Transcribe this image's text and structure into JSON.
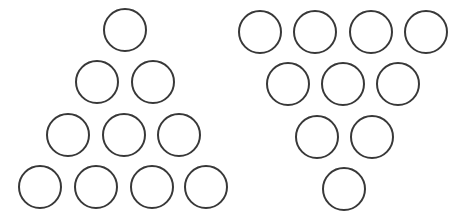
{
  "diagram": {
    "stroke_color": "#383838",
    "fill_color": "#ffffff",
    "radius": 21,
    "stroke_width": 2,
    "groups": [
      {
        "name": "upward-triangle",
        "circles": [
          {
            "cx": 125,
            "cy": 30
          },
          {
            "cx": 97,
            "cy": 82
          },
          {
            "cx": 153,
            "cy": 82
          },
          {
            "cx": 68,
            "cy": 135
          },
          {
            "cx": 124,
            "cy": 135
          },
          {
            "cx": 179,
            "cy": 135
          },
          {
            "cx": 40,
            "cy": 187
          },
          {
            "cx": 96,
            "cy": 187
          },
          {
            "cx": 152,
            "cy": 187
          },
          {
            "cx": 206,
            "cy": 187
          }
        ]
      },
      {
        "name": "downward-triangle",
        "circles": [
          {
            "cx": 260,
            "cy": 32
          },
          {
            "cx": 315,
            "cy": 32
          },
          {
            "cx": 371,
            "cy": 32
          },
          {
            "cx": 426,
            "cy": 32
          },
          {
            "cx": 288,
            "cy": 84
          },
          {
            "cx": 343,
            "cy": 84
          },
          {
            "cx": 398,
            "cy": 84
          },
          {
            "cx": 317,
            "cy": 137
          },
          {
            "cx": 372,
            "cy": 137
          },
          {
            "cx": 344,
            "cy": 189
          }
        ]
      }
    ]
  }
}
